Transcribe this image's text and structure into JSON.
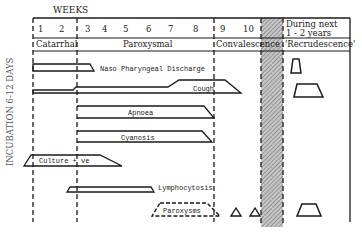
{
  "header": {
    "weeks_label": "WEEKS",
    "week_numbers": [
      "1",
      "2",
      "3",
      "4",
      "5",
      "6",
      "7",
      "8",
      "9",
      "10"
    ],
    "later_label_line1": "During next",
    "later_label_line2": "1 - 2 years"
  },
  "stages": {
    "catarrhal": "Catarrhal",
    "paroxysmal": "Paroxysmal",
    "convalescence": "Convalescence",
    "recrudescence": "'Recrudescence'"
  },
  "side_label": "INCUBATION 6-12 DAYS",
  "bars": {
    "naso": "Naso Pharyngeal Discharge",
    "cough": "Cough",
    "apnoea": "Apnoea",
    "cyanosis": "Cyanosis",
    "culture": "Culture + ve",
    "lymphocytosis": "Lymphocytosis",
    "paroxysms": "Paroxysms"
  },
  "colors": {
    "ink": "#1a1a1a",
    "hatch": "#9a9a9a",
    "background": "#ffffff"
  }
}
